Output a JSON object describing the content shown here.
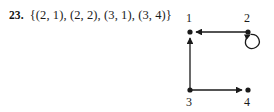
{
  "exercise": {
    "number": "23.",
    "relation_set": "{(2, 1), (2, 2), (3, 1), (3, 4)}"
  },
  "digraph": {
    "nodes": [
      {
        "id": "1",
        "label": "1",
        "x": 14,
        "y": 32,
        "label_x": 13,
        "label_y": 22,
        "label_pos": "above"
      },
      {
        "id": "2",
        "label": "2",
        "x": 72,
        "y": 32,
        "label_x": 71,
        "label_y": 22,
        "label_pos": "above"
      },
      {
        "id": "3",
        "label": "3",
        "x": 14,
        "y": 90,
        "label_x": 13,
        "label_y": 106,
        "label_pos": "below"
      },
      {
        "id": "4",
        "label": "4",
        "x": 72,
        "y": 90,
        "label_x": 71,
        "label_y": 106,
        "label_pos": "below"
      }
    ],
    "edges": [
      {
        "from": "2",
        "to": "1",
        "kind": "straight",
        "direction": "left"
      },
      {
        "from": "2",
        "to": "2",
        "kind": "self-loop",
        "direction": "clockwise"
      },
      {
        "from": "3",
        "to": "1",
        "kind": "straight",
        "direction": "up"
      },
      {
        "from": "3",
        "to": "4",
        "kind": "straight",
        "direction": "right"
      }
    ],
    "style": {
      "stroke_color": "#1a1a1a",
      "node_fill": "#1a1a1a",
      "node_radius": 2.6,
      "stroke_width": 1.3
    }
  }
}
